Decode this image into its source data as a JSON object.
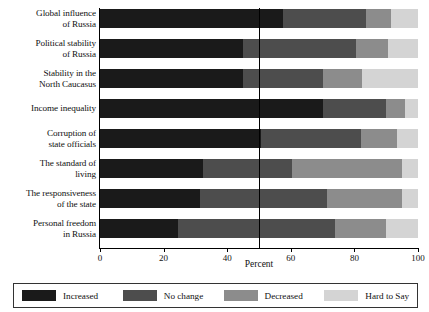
{
  "chart_data": {
    "type": "bar",
    "orientation": "horizontal",
    "stacked": true,
    "title": "",
    "xlabel": "Percent",
    "ylabel": "",
    "xlim": [
      0,
      100
    ],
    "xticks": [
      0,
      20,
      40,
      60,
      80,
      100
    ],
    "xtick_labels": [
      "0",
      "20",
      "40",
      "60",
      "80",
      "100"
    ],
    "grid": false,
    "reference_line": 50,
    "legend_position": "bottom",
    "categories": [
      "Global influence of Russia",
      "Political stability of Russia",
      "Stability in the North Caucasus",
      "Income inequality",
      "Corruption of state officials",
      "The standard of living",
      "The responsiveness of the state",
      "Personal freedom in Russia"
    ],
    "category_lines": [
      [
        "Global influence",
        "of Russia"
      ],
      [
        "Political stability",
        "of Russia"
      ],
      [
        "Stability in the",
        "North Caucasus"
      ],
      [
        "Income inequality"
      ],
      [
        "Corruption of",
        "state officials"
      ],
      [
        "The standard of",
        "living"
      ],
      [
        "The responsiveness",
        "of the state"
      ],
      [
        "Personal freedom",
        "in Russia"
      ]
    ],
    "series": [
      {
        "name": "Increased",
        "color": "#1a1a1a",
        "values": [
          57.5,
          45.0,
          45.0,
          70.0,
          50.5,
          32.5,
          31.5,
          24.5
        ]
      },
      {
        "name": "No change",
        "color": "#4d4d4d",
        "values": [
          26.0,
          35.5,
          25.0,
          20.0,
          31.5,
          28.0,
          40.0,
          49.5
        ]
      },
      {
        "name": "Decreased",
        "color": "#8c8c8c",
        "values": [
          8.0,
          10.0,
          12.5,
          6.0,
          11.5,
          34.5,
          23.5,
          16.0
        ]
      },
      {
        "name": "Hard to Say",
        "color": "#d4d4d4",
        "values": [
          8.5,
          9.5,
          17.5,
          4.0,
          6.5,
          5.0,
          5.0,
          10.0
        ]
      }
    ]
  },
  "axis": {
    "x_title": "Percent",
    "tick_labels": [
      "0",
      "20",
      "40",
      "60",
      "80",
      "100"
    ]
  },
  "legend": {
    "items": [
      {
        "label": "Increased",
        "color": "#1a1a1a"
      },
      {
        "label": "No change",
        "color": "#4d4d4d"
      },
      {
        "label": "Decreased",
        "color": "#8c8c8c"
      },
      {
        "label": "Hard to Say",
        "color": "#d4d4d4"
      }
    ]
  }
}
